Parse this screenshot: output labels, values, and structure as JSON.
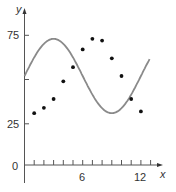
{
  "chart_data": {
    "type": "scatter",
    "title": "",
    "xlabel": "x",
    "ylabel": "y",
    "x_ticks": [
      6,
      12
    ],
    "y_ticks": [
      0,
      25,
      75
    ],
    "xlim": [
      0,
      13.5
    ],
    "ylim": [
      0,
      80
    ],
    "grid": false,
    "series": [
      {
        "name": "data points",
        "kind": "scatter",
        "x": [
          1,
          2,
          3,
          4,
          5,
          6,
          7,
          8,
          9,
          10,
          11,
          12
        ],
        "y": [
          31,
          34,
          39,
          49,
          57,
          67,
          73,
          72,
          62,
          52,
          39,
          32
        ]
      },
      {
        "name": "sinusoidal model",
        "kind": "line",
        "equation": "y = 52 + 21 sin(pi x / 6)",
        "x_range": [
          0,
          12.9
        ],
        "color": "#8a8a8a"
      }
    ]
  },
  "labels": {
    "y_axis": "y",
    "x_axis": "x",
    "tick_75": "75",
    "tick_25": "25",
    "tick_0": "0",
    "tick_6": "6",
    "tick_12": "12"
  }
}
